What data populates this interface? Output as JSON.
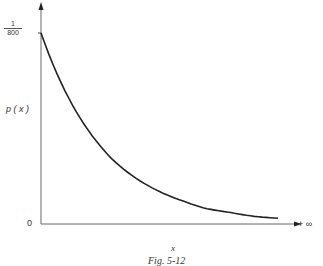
{
  "chart_data": {
    "type": "line",
    "title": "",
    "caption": "Fig. 5-12",
    "xlabel": "x",
    "ylabel": "p(x)",
    "y_tick_labels": [
      {
        "numerator": "1",
        "denominator": "800",
        "meaning": "1/800"
      }
    ],
    "x_tick_labels": [
      "0",
      "+ ∞"
    ],
    "grid": false,
    "legend": null,
    "series": [
      {
        "name": "p(x)",
        "description": "exponentially decaying density starting at 1/800 at x=0 and approaching 0 as x → +∞",
        "x_relative": [
          0,
          0.1,
          0.2,
          0.3,
          0.4,
          0.5,
          0.6,
          0.7,
          0.8,
          0.9,
          1.0
        ],
        "y_relative": [
          1.0,
          0.7,
          0.49,
          0.34,
          0.24,
          0.17,
          0.12,
          0.08,
          0.06,
          0.04,
          0.03
        ]
      }
    ],
    "ylim": [
      0,
      "1/800"
    ],
    "xlim": [
      0,
      "+∞"
    ]
  },
  "labels": {
    "y_tick_num": "1",
    "y_tick_den": "800",
    "ylabel": "p ( x )",
    "origin": "0",
    "x_end": "+ ∞",
    "xlabel": "x",
    "caption": "Fig. 5-12"
  }
}
